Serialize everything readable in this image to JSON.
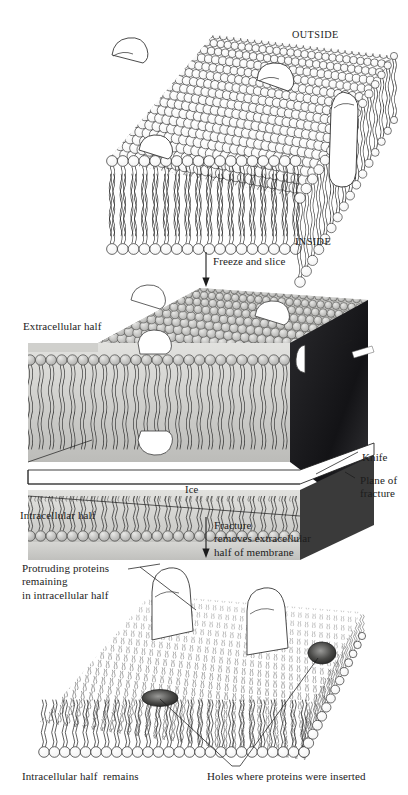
{
  "figure": {
    "type": "scientific-diagram",
    "background_color": "#ffffff",
    "ink_color": "#1c1c1c",
    "panels": [
      {
        "id": "panel-intact-membrane",
        "caption": "Intact phospholipid bilayer membrane with embedded proteins shown in 3D perspective",
        "labels": [
          "OUTSIDE",
          "INSIDE"
        ]
      },
      {
        "id": "panel-frozen-sliced",
        "caption": "Frozen membrane in ice being split by a knife along the plane of fracture",
        "labels": [
          "Extracellular half",
          "Intracellular half",
          "Ice",
          "Knife",
          "Plane of fracture"
        ]
      },
      {
        "id": "panel-fractured",
        "caption": "Intracellular half remaining after the extracellular half is removed",
        "labels": [
          "Protruding proteins remaining in intracellular half",
          "Intracellular half  remains",
          "Holes where proteins were inserted"
        ]
      }
    ]
  },
  "labels": {
    "outside": "OUTSIDE",
    "inside": "INSIDE",
    "freeze_and_slice": "Freeze and slice",
    "extracellular_half": "Extracellular half",
    "intracellular_half": "Intracellular half",
    "ice": "Ice",
    "knife": "Knife",
    "plane_of_fracture_line1": "Plane of",
    "plane_of_fracture_line2": "fracture",
    "fracture_line1": "Fracture",
    "fracture_line2": "removes extracellular",
    "fracture_line3": "half of membrane",
    "protruding_line1": "Protruding proteins",
    "protruding_line2": "remaining",
    "protruding_line3": "in intracellular half",
    "intracellular_half_remains": "Intracellular half  remains",
    "holes_where_proteins": "Holes where proteins were inserted"
  },
  "colors": {
    "paper": "#ffffff",
    "ink": "#1c1c1c",
    "lipid_head_fill": "#fbfbfb",
    "photo_light_gray": "#d8d8d6",
    "photo_mid_gray": "#b3b3b1",
    "photo_dark_gray": "#6e6e6c",
    "knife_black": "#17171a",
    "hole_dark": "#2b2b2b"
  },
  "arrows": [
    {
      "name": "freeze-and-slice-arrow",
      "from_panel": "panel-intact-membrane",
      "to_panel": "panel-frozen-sliced"
    },
    {
      "name": "fracture-arrow",
      "from_panel": "panel-frozen-sliced",
      "to_panel": "panel-fractured"
    }
  ]
}
